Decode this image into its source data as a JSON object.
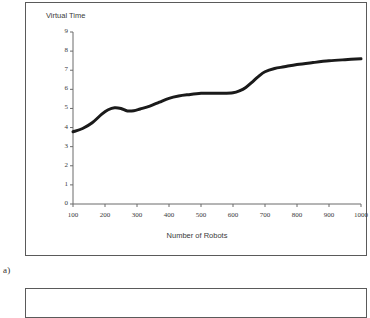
{
  "figure": {
    "caption_label": "a)",
    "panel_border_color": "#5a5a5a"
  },
  "chart_data": {
    "type": "line",
    "title": "",
    "xlabel": "Number of Robots",
    "ylabel": "Virtual Time",
    "xlim": [
      100,
      1000
    ],
    "ylim": [
      0,
      9
    ],
    "grid": false,
    "legend": null,
    "line_color": "#1a1a1a",
    "line_width": 3,
    "xticks": [
      100,
      200,
      300,
      400,
      500,
      600,
      700,
      800,
      900,
      1000
    ],
    "xtick_labels": [
      "100",
      "200",
      "300",
      "400",
      "500",
      "600",
      "700",
      "800",
      "900",
      "1000"
    ],
    "yticks": [
      0,
      1,
      2,
      3,
      4,
      5,
      6,
      7,
      8,
      9
    ],
    "ytick_labels": [
      "0",
      "1",
      "2",
      "3",
      "4",
      "5",
      "6",
      "7",
      "8",
      "9"
    ],
    "x": [
      100,
      130,
      160,
      190,
      210,
      230,
      250,
      270,
      290,
      310,
      340,
      370,
      400,
      430,
      460,
      500,
      540,
      570,
      600,
      620,
      640,
      660,
      680,
      700,
      730,
      760,
      800,
      850,
      900,
      950,
      1000
    ],
    "values": [
      3.78,
      3.95,
      4.25,
      4.7,
      4.93,
      5.04,
      5.0,
      4.87,
      4.88,
      4.97,
      5.12,
      5.33,
      5.53,
      5.65,
      5.72,
      5.79,
      5.8,
      5.79,
      5.82,
      5.92,
      6.1,
      6.38,
      6.68,
      6.92,
      7.09,
      7.18,
      7.3,
      7.4,
      7.49,
      7.55,
      7.6
    ]
  }
}
